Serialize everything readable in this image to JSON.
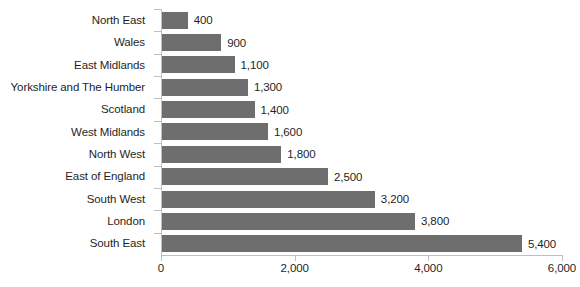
{
  "chart_data": {
    "type": "bar",
    "orientation": "horizontal",
    "title": "",
    "subtitle": "",
    "xlabel": "",
    "ylabel": "",
    "categories": [
      "North East",
      "Wales",
      "East Midlands",
      "Yorkshire and The Humber",
      "Scotland",
      "West Midlands",
      "North West",
      "East of England",
      "South West",
      "London",
      "South East"
    ],
    "values": [
      400,
      900,
      1100,
      1300,
      1400,
      1600,
      1800,
      2500,
      3200,
      3800,
      5400
    ],
    "data_labels": [
      "400",
      "900",
      "1,100",
      "1,300",
      "1,400",
      "1,600",
      "1,800",
      "2,500",
      "3,200",
      "3,800",
      "5,400"
    ],
    "xlim": [
      0,
      6000
    ],
    "xticks": [
      0,
      2000,
      4000,
      6000
    ],
    "xtick_labels": [
      "0",
      "2,000",
      "4,000",
      "6,000"
    ],
    "grid": false,
    "legend": null,
    "bar_color": "#6E6E6E",
    "axis_color": "#BFBFBF",
    "text_color": "#1F1F1F",
    "background_color": "#FFFFFF"
  }
}
